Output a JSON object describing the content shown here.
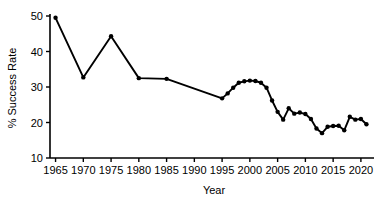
{
  "chart_data": {
    "type": "line",
    "title": "",
    "subtitle": "",
    "xlabel": "Year",
    "ylabel": "% Success Rate",
    "xlim": [
      1964,
      2022
    ],
    "ylim": [
      10,
      50
    ],
    "xticks": [
      1965,
      1970,
      1975,
      1980,
      1985,
      1990,
      1995,
      2000,
      2005,
      2010,
      2015,
      2020
    ],
    "yticks": [
      10,
      20,
      30,
      40,
      50
    ],
    "xtick_labels": [
      "1965",
      "1970",
      "1975",
      "1980",
      "1985",
      "1990",
      "1995",
      "2000",
      "2005",
      "2010",
      "2015",
      "2020"
    ],
    "ytick_labels": [
      "10",
      "20",
      "30",
      "40",
      "50"
    ],
    "grid": false,
    "legend": false,
    "legend_position": "none",
    "line_color": "#000000",
    "marker": "circle",
    "marker_color": "#000000",
    "series": [
      {
        "name": "% Success Rate",
        "x": [
          1965,
          1970,
          1975,
          1980,
          1985,
          1995,
          1996,
          1997,
          1998,
          1999,
          2000,
          2001,
          2002,
          2003,
          2004,
          2005,
          2006,
          2007,
          2008,
          2009,
          2010,
          2011,
          2012,
          2013,
          2014,
          2015,
          2016,
          2017,
          2018,
          2019,
          2020,
          2021
        ],
        "values": [
          49.5,
          32.7,
          44.3,
          32.5,
          32.3,
          26.8,
          28.2,
          29.8,
          31.2,
          31.6,
          31.8,
          31.7,
          31.2,
          29.8,
          26.2,
          23.0,
          20.8,
          24.0,
          22.5,
          22.8,
          22.4,
          21.0,
          18.3,
          17.0,
          18.8,
          19.0,
          19.1,
          17.8,
          21.6,
          20.8,
          21.0,
          19.5
        ]
      }
    ]
  }
}
